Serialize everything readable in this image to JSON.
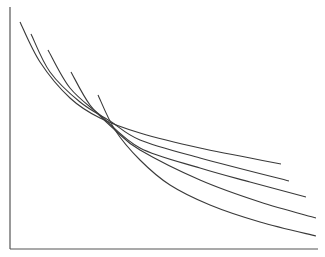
{
  "chart_data": {
    "type": "line",
    "title": "",
    "xlabel": "",
    "ylabel": "",
    "grid": false,
    "legend": null,
    "note": "Five unlabeled decreasing convex curves (indifference-curve style); no tick labels shown. Values in pixel coordinates of plot area.",
    "axes": {
      "origin": [
        10,
        249
      ],
      "x_end": [
        318,
        249
      ],
      "y_end": [
        10,
        7
      ]
    },
    "series": [
      {
        "name": "curve-1",
        "points": [
          [
            20,
            22
          ],
          [
            40,
            62
          ],
          [
            70,
            98
          ],
          [
            100,
            118
          ],
          [
            140,
            133
          ],
          [
            200,
            148
          ],
          [
            281,
            164
          ]
        ]
      },
      {
        "name": "curve-2",
        "points": [
          [
            31,
            34
          ],
          [
            50,
            72
          ],
          [
            80,
            102
          ],
          [
            110,
            121
          ],
          [
            140,
            140
          ],
          [
            200,
            158
          ],
          [
            289,
            181
          ]
        ]
      },
      {
        "name": "curve-3",
        "points": [
          [
            48,
            50
          ],
          [
            70,
            88
          ],
          [
            100,
            115
          ],
          [
            140,
            148
          ],
          [
            200,
            168
          ],
          [
            250,
            182
          ],
          [
            306,
            197
          ]
        ]
      },
      {
        "name": "curve-4",
        "points": [
          [
            71,
            72
          ],
          [
            90,
            105
          ],
          [
            115,
            130
          ],
          [
            140,
            150
          ],
          [
            200,
            180
          ],
          [
            260,
            202
          ],
          [
            316,
            218
          ]
        ]
      },
      {
        "name": "curve-5",
        "points": [
          [
            98,
            95
          ],
          [
            115,
            130
          ],
          [
            140,
            160
          ],
          [
            170,
            185
          ],
          [
            210,
            205
          ],
          [
            260,
            222
          ],
          [
            316,
            236
          ]
        ]
      }
    ]
  },
  "colors": {
    "line": "#3a3a3a",
    "axis": "#555555",
    "background": "#ffffff"
  }
}
